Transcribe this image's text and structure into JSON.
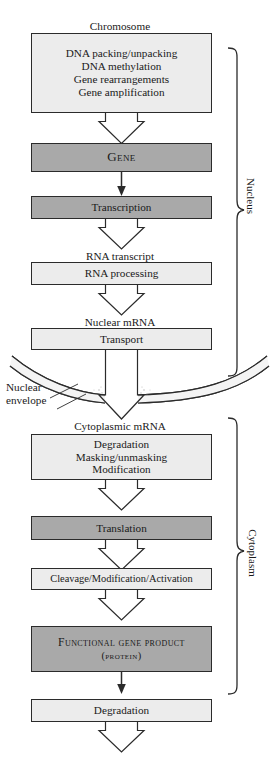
{
  "diagram": {
    "colors": {
      "box_light_fill": "#ececec",
      "box_dark_fill": "#a9a9a9",
      "stroke": "#2b2b2b",
      "page_background": "#ffffff"
    },
    "labels": {
      "chromosome": "Chromosome",
      "rna_transcript": "RNA transcript",
      "nuclear_mrna": "Nuclear mRNA",
      "cytoplasmic_mrna": "Cytoplasmic mRNA",
      "nuclear_envelope_line1": "Nuclear",
      "nuclear_envelope_line2": "envelope"
    },
    "compartments": [
      {
        "name": "nucleus",
        "label": "Nucleus"
      },
      {
        "name": "cytoplasm",
        "label": "Cytoplasm"
      }
    ],
    "boxes": [
      {
        "name": "chromosome-modifications",
        "style": "light",
        "lines": [
          "DNA packing/unpacking",
          "DNA methylation",
          "Gene rearrangements",
          "Gene amplification"
        ]
      },
      {
        "name": "gene",
        "style": "dark",
        "smallcaps": true,
        "lines": [
          "Gene"
        ]
      },
      {
        "name": "transcription",
        "style": "dark",
        "lines": [
          "Transcription"
        ]
      },
      {
        "name": "rna-processing",
        "style": "light",
        "lines": [
          "RNA processing"
        ]
      },
      {
        "name": "transport",
        "style": "light",
        "lines": [
          "Transport"
        ]
      },
      {
        "name": "mrna-fate",
        "style": "light",
        "lines": [
          "Degradation",
          "Masking/unmasking",
          "Modification"
        ]
      },
      {
        "name": "translation",
        "style": "dark",
        "lines": [
          "Translation"
        ]
      },
      {
        "name": "cleavage-modification-activation",
        "style": "light",
        "lines": [
          "Cleavage/Modification/Activation"
        ]
      },
      {
        "name": "functional-gene-product",
        "style": "dark",
        "smallcaps": true,
        "lines": [
          "Functional gene product",
          "(protein)"
        ]
      },
      {
        "name": "protein-degradation",
        "style": "light",
        "lines": [
          "Degradation"
        ]
      }
    ]
  }
}
